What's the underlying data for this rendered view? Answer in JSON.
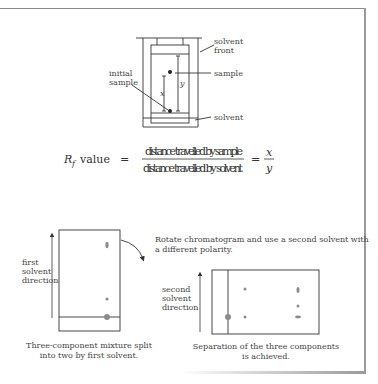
{
  "tank_diagram": {
    "labels": {
      "solvent_front_line1": "solvent",
      "solvent_front_line2": "front",
      "sample": "sample",
      "initial_sample_line1": "initial",
      "initial_sample_line2": "sample",
      "solvent": "solvent",
      "x": "x",
      "y": "y"
    }
  },
  "formula": {
    "rf_symbol": "R",
    "rf_subscript": "f",
    "rf_label": "value",
    "equals1": "=",
    "numerator": "distance travelled by sample",
    "denominator": "distance travelled by solvent",
    "equals2": "=",
    "frac_num": "x",
    "frac_den": "y"
  },
  "two_way": {
    "first_direction_line1": "first",
    "first_direction_line2": "solvent",
    "first_direction_line3": "direction",
    "rotate_note_line1": "Rotate chromatogram and use a second solvent with",
    "rotate_note_line2": "a different polarity.",
    "second_direction_line1": "second",
    "second_direction_line2": "solvent",
    "second_direction_line3": "direction",
    "caption_left_line1": "Three-component mixture split",
    "caption_left_line2": "into two by first solvent.",
    "caption_right_line1": "Separation of the three components",
    "caption_right_line2": "is achieved."
  },
  "colors": {
    "line": "#333333",
    "spot": "#8c8c8c",
    "frame": "#8a8a8a"
  }
}
